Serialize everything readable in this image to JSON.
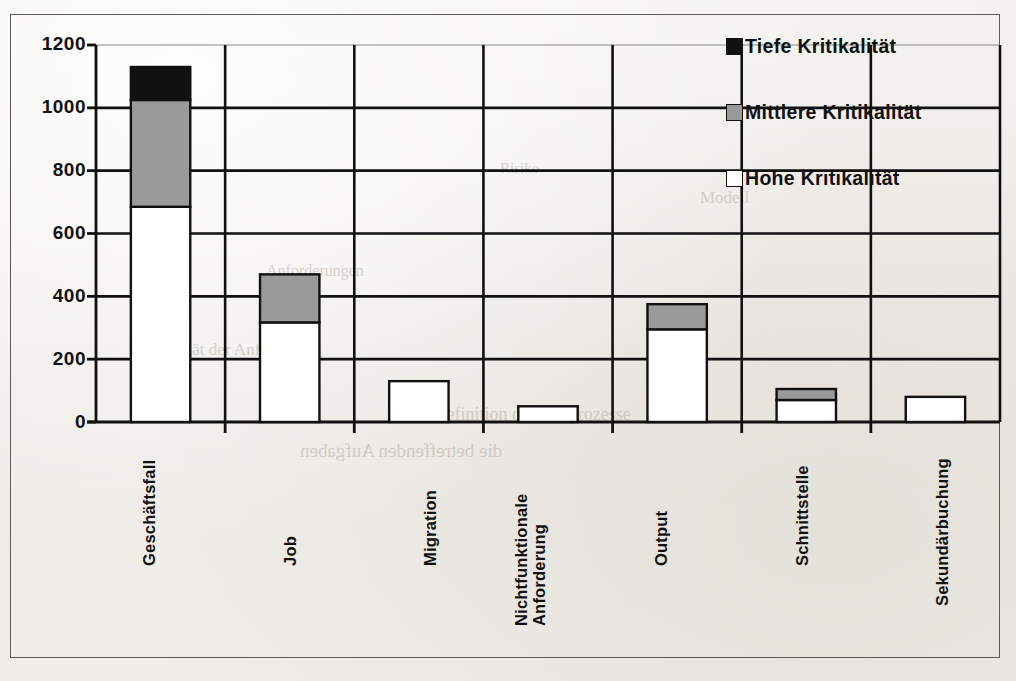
{
  "chart_data": {
    "type": "bar",
    "subtype": "stacked-vertical",
    "title": "",
    "xlabel": "",
    "ylabel": "",
    "ylim": [
      0,
      1200
    ],
    "yticks": [
      0,
      200,
      400,
      600,
      800,
      1000,
      1200
    ],
    "ytick_labels": [
      "0",
      "200",
      "400",
      "600",
      "800",
      "1000",
      "1200"
    ],
    "grid": "horizontal-and-vertical",
    "legend_position": "top-right",
    "categories": [
      "Geschäftsfall",
      "Job",
      "Migration",
      "Nichtfunktionale\nAnforderung",
      "Output",
      "Schnittstelle",
      "Sekundärbuchung"
    ],
    "series": [
      {
        "name": "Hohe Kritikalität",
        "color": "#ffffff",
        "values": [
          685,
          317,
          130,
          50,
          295,
          70,
          80
        ]
      },
      {
        "name": "Mittlere Kritikalität",
        "color": "#9a9a9a",
        "values": [
          340,
          153,
          0,
          0,
          80,
          35,
          0
        ]
      },
      {
        "name": "Tiefe Kritikalität",
        "color": "#111111",
        "values": [
          105,
          0,
          0,
          0,
          0,
          0,
          0
        ]
      }
    ],
    "totals": [
      1130,
      470,
      130,
      50,
      375,
      105,
      80
    ],
    "stack_order_bottom_to_top": [
      "Hohe Kritikalität",
      "Mittlere Kritikalität",
      "Tiefe Kritikalität"
    ]
  },
  "legend": {
    "items": [
      {
        "label": "Tiefe Kritikalität",
        "swatch": "black-square-icon"
      },
      {
        "label": "Mittlere Kritikalität",
        "swatch": "gray-square-icon"
      },
      {
        "label": "Hohe Kritikalität",
        "swatch": "white-square-icon"
      }
    ]
  },
  "axes": {
    "y_ticks": [
      "1200",
      "1000",
      "800",
      "600",
      "400",
      "200",
      "0"
    ],
    "x_categories": [
      "Geschäftsfall",
      "Job",
      "Migration",
      "Nichtfunktionale\nAnforderung",
      "Output",
      "Schnittstelle",
      "Sekundärbuchung"
    ]
  },
  "colors": {
    "tief": "#111111",
    "mittel": "#9a9a9a",
    "hoch": "#ffffff",
    "axis": "#111111",
    "frame": "#5d5a55",
    "page": "#f1efea"
  },
  "page_bleed": {
    "lines": [
      "Modell",
      "Risiko",
      "Anforderungen",
      "die betreffenden Aufgaben",
      "3 Definition der Testprozesse",
      "Kritikalität der Anforderung"
    ]
  }
}
